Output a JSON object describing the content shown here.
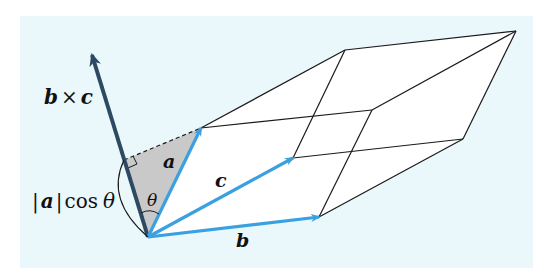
{
  "figure": {
    "type": "parallelepiped-volume-diagram",
    "background_color": "#eaf8fc",
    "vector_color": "#3aa0e0",
    "normal_color": "#2e4a63",
    "shade_color": "#c9c9c9"
  },
  "labels": {
    "normal_vector": "b × c",
    "normal_b": "b",
    "normal_times": "×",
    "normal_c": "c",
    "vector_a": "a",
    "vector_b": "b",
    "vector_c": "c",
    "angle": "θ",
    "height_bar_open": "|",
    "height_a": "a",
    "height_bar_close": "|",
    "height_cos": "cos",
    "height_theta": "θ"
  },
  "geometry": {
    "origin": [
      148,
      237
    ],
    "a_tip": [
      201,
      128
    ],
    "b_tip": [
      319,
      217
    ],
    "c_tip": [
      293,
      158
    ],
    "a_plus_b": [
      372,
      110
    ],
    "a_plus_c": [
      345,
      50
    ],
    "b_plus_c": [
      463,
      139
    ],
    "a_plus_b_plus_c": [
      516,
      31
    ],
    "normal_tip": [
      92,
      55
    ]
  }
}
